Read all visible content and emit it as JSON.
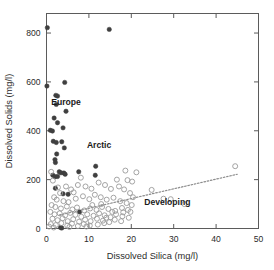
{
  "chart_data": {
    "type": "scatter",
    "title": "",
    "xlabel": "Dissolved Silica (mg/l)",
    "ylabel": "Dissolved Solids (mg/l)",
    "xlim": [
      0,
      50
    ],
    "ylim": [
      0,
      880
    ],
    "xticks": [
      0,
      10,
      20,
      30,
      40,
      50
    ],
    "yticks": [
      0,
      200,
      400,
      600,
      800
    ],
    "xtick_labels": [
      "0",
      "10",
      "20",
      "30",
      "40",
      "50"
    ],
    "ytick_labels": [
      "0",
      "200",
      "400",
      "600",
      "800"
    ],
    "grid": false,
    "legend": "none",
    "frame": "box",
    "annotations": [
      {
        "text": "Europe",
        "x": 4.6,
        "y": 505
      },
      {
        "text": "Arctic",
        "x": 12.4,
        "y": 330
      },
      {
        "text": "Developing",
        "x": 28.5,
        "y": 95
      }
    ],
    "series": [
      {
        "name": "Europe",
        "marker": "filled-circle",
        "color": "#3f3f3f",
        "points": [
          [
            0.2,
            822
          ],
          [
            14.8,
            815
          ],
          [
            0.1,
            583
          ],
          [
            4.3,
            598
          ],
          [
            2.2,
            545
          ],
          [
            2.6,
            542
          ],
          [
            2.3,
            508
          ],
          [
            4.6,
            480
          ],
          [
            1.8,
            452
          ],
          [
            2.6,
            433
          ],
          [
            0.9,
            402
          ],
          [
            1.4,
            399
          ],
          [
            3.9,
            412
          ],
          [
            1.6,
            357
          ],
          [
            2.3,
            352
          ],
          [
            3.6,
            355
          ],
          [
            4.2,
            330
          ],
          [
            2.4,
            305
          ],
          [
            2.0,
            282
          ],
          [
            2.1,
            270
          ],
          [
            3.0,
            232
          ],
          [
            3.4,
            228
          ],
          [
            4.1,
            227
          ],
          [
            4.4,
            222
          ],
          [
            1.5,
            218
          ],
          [
            2.0,
            212
          ],
          [
            2.6,
            213
          ],
          [
            7.6,
            232
          ],
          [
            11.6,
            255
          ],
          [
            11.5,
            218
          ],
          [
            3.9,
            142
          ],
          [
            5.1,
            140
          ],
          [
            2.1,
            165
          ],
          [
            7.8,
            68
          ],
          [
            3.3,
            4
          ],
          [
            3.6,
            2
          ]
        ]
      },
      {
        "name": "Developing",
        "marker": "open-circle",
        "color": "#9a9a9a",
        "points": [
          [
            44.5,
            255
          ],
          [
            18.6,
            237
          ],
          [
            21.2,
            230
          ],
          [
            19.1,
            198
          ],
          [
            20.2,
            192
          ],
          [
            16.6,
            200
          ],
          [
            24.8,
            158
          ],
          [
            8.1,
            208
          ],
          [
            7.4,
            178
          ],
          [
            9.2,
            172
          ],
          [
            10.6,
            163
          ],
          [
            12.3,
            188
          ],
          [
            13.8,
            178
          ],
          [
            15.2,
            162
          ],
          [
            17.1,
            172
          ],
          [
            18.3,
            160
          ],
          [
            19.7,
            145
          ],
          [
            20.4,
            128
          ],
          [
            27.6,
            122
          ],
          [
            29.3,
            120
          ],
          [
            32.5,
            100
          ],
          [
            1.1,
            232
          ],
          [
            1.5,
            196
          ],
          [
            2.7,
            168
          ],
          [
            4.6,
            172
          ],
          [
            5.8,
            160
          ],
          [
            6.4,
            148
          ],
          [
            3.2,
            145
          ],
          [
            1.8,
            128
          ],
          [
            2.4,
            118
          ],
          [
            4.0,
            112
          ],
          [
            5.2,
            108
          ],
          [
            6.9,
            122
          ],
          [
            8.6,
            132
          ],
          [
            10.1,
            120
          ],
          [
            11.4,
            138
          ],
          [
            12.8,
            128
          ],
          [
            14.2,
            118
          ],
          [
            15.8,
            126
          ],
          [
            17.4,
            112
          ],
          [
            18.9,
            104
          ],
          [
            20.1,
            96
          ],
          [
            1.2,
            96
          ],
          [
            2.1,
            88
          ],
          [
            3.4,
            82
          ],
          [
            4.8,
            90
          ],
          [
            6.1,
            78
          ],
          [
            7.2,
            86
          ],
          [
            8.9,
            74
          ],
          [
            10.3,
            82
          ],
          [
            11.8,
            76
          ],
          [
            13.1,
            88
          ],
          [
            14.6,
            80
          ],
          [
            16.2,
            72
          ],
          [
            17.8,
            84
          ],
          [
            19.2,
            76
          ],
          [
            0.9,
            68
          ],
          [
            1.9,
            58
          ],
          [
            3.1,
            62
          ],
          [
            4.4,
            54
          ],
          [
            5.6,
            64
          ],
          [
            6.8,
            56
          ],
          [
            8.2,
            48
          ],
          [
            9.6,
            58
          ],
          [
            11.1,
            52
          ],
          [
            12.4,
            62
          ],
          [
            13.7,
            54
          ],
          [
            15.1,
            46
          ],
          [
            16.4,
            58
          ],
          [
            17.9,
            50
          ],
          [
            19.4,
            44
          ],
          [
            1.4,
            40
          ],
          [
            2.6,
            34
          ],
          [
            3.8,
            42
          ],
          [
            5.0,
            30
          ],
          [
            6.3,
            38
          ],
          [
            7.7,
            28
          ],
          [
            9.1,
            36
          ],
          [
            10.4,
            30
          ],
          [
            11.9,
            40
          ],
          [
            13.3,
            32
          ],
          [
            14.8,
            26
          ],
          [
            16.1,
            36
          ],
          [
            17.6,
            30
          ],
          [
            1.0,
            18
          ],
          [
            2.2,
            14
          ],
          [
            3.5,
            22
          ],
          [
            4.9,
            12
          ],
          [
            6.0,
            20
          ],
          [
            7.4,
            10
          ],
          [
            8.8,
            18
          ],
          [
            10.2,
            12
          ],
          [
            12.1,
            16
          ],
          [
            13.6,
            22
          ],
          [
            0.6,
            8
          ],
          [
            1.7,
            4
          ],
          [
            5.4,
            6
          ],
          [
            9.4,
            8
          ],
          [
            14.1,
            44
          ],
          [
            15.5,
            68
          ],
          [
            18.1,
            66
          ],
          [
            19.8,
            68
          ],
          [
            12.9,
            100
          ],
          [
            10.8,
            96
          ]
        ]
      }
    ],
    "trendline": {
      "name": "Developing trend",
      "style": "dotted",
      "color": "#8c8c8c",
      "x_start": 3.0,
      "y_start": 55,
      "x_end": 45.0,
      "y_end": 222
    }
  }
}
